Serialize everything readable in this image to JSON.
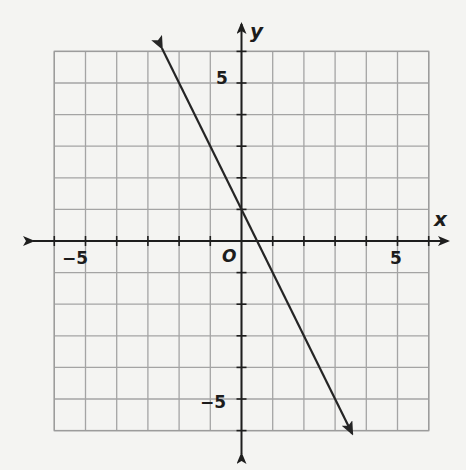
{
  "chart_data": {
    "type": "line",
    "title": "",
    "xlabel": "x",
    "ylabel": "y",
    "origin_label": "O",
    "xlim": [
      -6,
      6
    ],
    "ylim": [
      -6,
      6
    ],
    "grid": true,
    "x_tick_labels": [
      {
        "value": -5,
        "label": "−5"
      },
      {
        "value": 5,
        "label": "5"
      }
    ],
    "y_tick_labels": [
      {
        "value": 5,
        "label": "5"
      },
      {
        "value": -5,
        "label": "−5"
      }
    ],
    "series": [
      {
        "name": "line",
        "equation": "y = -2x + 1",
        "slope": -2,
        "y_intercept": 1,
        "x_intercept": 0.5,
        "arrows_both_ends": true,
        "points": [
          {
            "x": -2.55,
            "y": 6.1
          },
          {
            "x": 0,
            "y": 1
          },
          {
            "x": 0.5,
            "y": 0
          },
          {
            "x": 3.55,
            "y": -6.1
          }
        ]
      }
    ]
  },
  "colors": {
    "background": "#f4f4f2",
    "grid": "#a4a4a4",
    "axis": "#1e1e1e",
    "line": "#252525"
  }
}
